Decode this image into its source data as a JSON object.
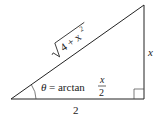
{
  "diagram": {
    "type": "right-triangle",
    "hypotenuse_label": {
      "radicand": "4 + x",
      "exponent": "2",
      "full": "√(4 + x²)"
    },
    "vertical_side_label": "x",
    "base_label": "2",
    "angle_label": {
      "symbol": "θ",
      "equals": "= arctan",
      "numerator": "x",
      "denominator": "2"
    },
    "right_angle_marker": true,
    "colors": {
      "stroke": "#222222",
      "background": "#ffffff"
    }
  }
}
